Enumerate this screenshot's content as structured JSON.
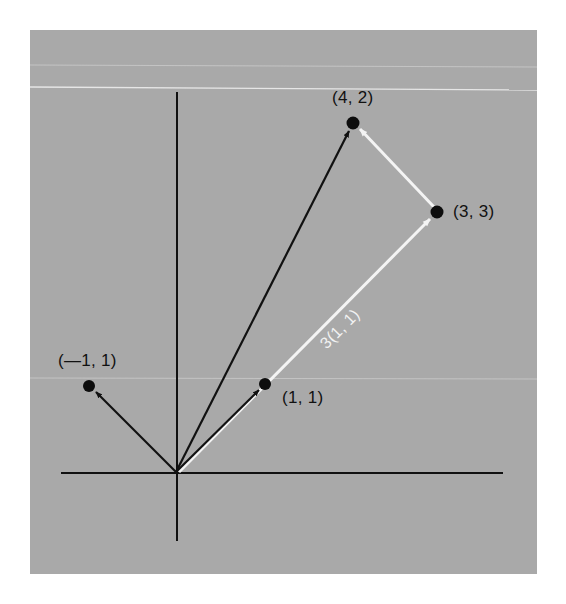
{
  "figure": {
    "background_color": "#a9a9a9",
    "axis_color": "#111111",
    "black_vector_color": "#111111",
    "white_vector_color": "#f4f4f4",
    "point_color": "#0d0d0d"
  },
  "points": [
    {
      "id": "p_neg1_1",
      "label": "(—1, 1)",
      "x": -1,
      "y": 1
    },
    {
      "id": "p_1_1",
      "label": "(1, 1)",
      "x": 1,
      "y": 1
    },
    {
      "id": "p_3_3",
      "label": "(3, 3)",
      "x": 3,
      "y": 3
    },
    {
      "id": "p_4_2",
      "label": "(4, 2)",
      "x": 4,
      "y": 2
    }
  ],
  "labels": {
    "neg1_1": "(—1, 1)",
    "one_one": "(1, 1)",
    "three_three": "(3, 3)",
    "four_two": "(4, 2)",
    "scaled_vector": "3(1, 1)"
  },
  "vectors": [
    {
      "from": "origin",
      "to": "(-1, 1)",
      "color": "black"
    },
    {
      "from": "origin",
      "to": "(1, 1)",
      "color": "black"
    },
    {
      "from": "origin",
      "to": "(4, 2)",
      "color": "black"
    },
    {
      "from": "origin",
      "to": "(3, 3)",
      "color": "white",
      "label": "3(1, 1)"
    },
    {
      "from": "(3, 3)",
      "to": "(4, 2)",
      "color": "white"
    }
  ]
}
